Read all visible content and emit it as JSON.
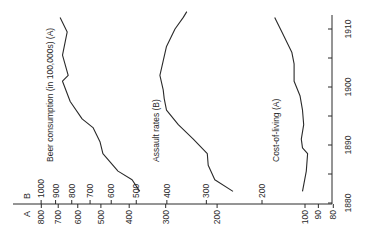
{
  "chart_data": {
    "type": "line",
    "orientation": "rotated-90-ccw",
    "title": "",
    "xlabel": "Year",
    "x_ticks": [
      1880,
      1890,
      1900,
      1910
    ],
    "x_minor_ticks": [
      1885,
      1895,
      1905
    ],
    "xlim": [
      1880,
      1913
    ],
    "axes": {
      "A": {
        "label": "A",
        "scale": "log",
        "ticks": [
          800,
          700,
          600,
          500,
          400,
          300,
          200,
          100,
          90,
          80
        ]
      },
      "B": {
        "label": "B",
        "scale": "log",
        "ticks": [
          1000,
          900,
          800,
          700,
          600,
          500,
          400,
          300,
          200
        ]
      }
    },
    "series": [
      {
        "name": "Beer consumption (in 100,000s) (A)",
        "axis": "A",
        "x": [
          1882,
          1884,
          1885.5,
          1888.5,
          1890.5,
          1893,
          1894.5,
          1897.5,
          1901,
          1902,
          1905.5,
          1909.5,
          1912
        ],
        "values": [
          368,
          391,
          437,
          492,
          503,
          532,
          580,
          637,
          677,
          647,
          677,
          652,
          690
        ]
      },
      {
        "name": "Assault rates (B)",
        "axis": "B",
        "x": [
          1882,
          1884,
          1886.5,
          1888.5,
          1891,
          1893.5,
          1896,
          1898,
          1899.5,
          1902,
          1904.5,
          1907,
          1910,
          1912,
          1913
        ],
        "values": [
          247,
          282,
          296,
          298,
          330,
          368,
          401,
          408,
          411,
          421,
          411,
          401,
          377,
          355,
          346
        ]
      },
      {
        "name": "Cost-of-living (A)",
        "axis": "A",
        "x": [
          1882,
          1885.5,
          1888.5,
          1889.5,
          1891,
          1893.5,
          1896,
          1898.5,
          1901,
          1904,
          1906,
          1909.5,
          1912
        ],
        "values": [
          102,
          99,
          98,
          102,
          103,
          101,
          102,
          104,
          109,
          109,
          111,
          120,
          127
        ]
      }
    ],
    "grid": false,
    "legend": "inline labels"
  },
  "labels": {
    "axis_a": "A",
    "axis_b": "B",
    "beer": "Beer consumption (in 100,000s) (A)",
    "assault": "Assault rates (B)",
    "cost": "Cost-of-living (A)"
  },
  "colors": {
    "line": "#2a2a2a",
    "background": "#ffffff"
  }
}
